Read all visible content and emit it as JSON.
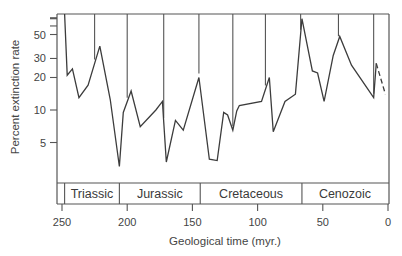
{
  "chart_data": {
    "type": "line",
    "title": "",
    "xlabel": "Geological time (myr.)",
    "ylabel": "Percent extinction rate",
    "x_reversed": true,
    "xlim": [
      250,
      0
    ],
    "y_scale": "log",
    "ylim": [
      2.5,
      100
    ],
    "x_ticks": [
      250,
      200,
      150,
      100,
      50,
      0
    ],
    "y_ticks": [
      5,
      10,
      20,
      30,
      50
    ],
    "y_minor_ticks_top": [
      60,
      70,
      80,
      90
    ],
    "grid": false,
    "legend": null,
    "series": [
      {
        "name": "Extinction rate",
        "style": "solid",
        "x": [
          248,
          246,
          242,
          237,
          230,
          221,
          213,
          206,
          203,
          197,
          190,
          178,
          173,
          170,
          163,
          157,
          145,
          137,
          131,
          126,
          123,
          119,
          116,
          114,
          97,
          91,
          88,
          79,
          71,
          66,
          58,
          54,
          49,
          42,
          37,
          28,
          11,
          9
        ],
        "values": [
          100,
          21,
          24,
          13,
          17,
          39,
          12.5,
          3,
          9.5,
          15,
          7,
          10,
          12,
          3.3,
          8,
          6.5,
          20,
          3.5,
          3.4,
          9.5,
          9,
          6.5,
          9.8,
          11,
          12,
          20,
          6.3,
          12,
          14,
          70,
          23,
          22,
          12,
          32,
          48,
          26,
          13,
          27
        ]
      },
      {
        "name": "Extinction rate (uncertain)",
        "style": "dashed",
        "x": [
          9,
          2
        ],
        "values": [
          27,
          14
        ]
      }
    ],
    "annotations": {
      "boundary_drop_lines_myr": [
        225,
        200,
        172,
        145,
        119,
        94,
        67,
        38,
        11
      ]
    },
    "periods": [
      {
        "name": "Triassic",
        "start": 248,
        "end": 206
      },
      {
        "name": "Jurassic",
        "start": 206,
        "end": 144
      },
      {
        "name": "Cretaceous",
        "start": 144,
        "end": 66
      },
      {
        "name": "Cenozoic",
        "start": 66,
        "end": 0
      }
    ]
  },
  "labels": {
    "y_axis": "Percent extinction rate",
    "x_axis": "Geological time (myr.)",
    "x_ticks": [
      "250",
      "200",
      "150",
      "100",
      "50",
      "0"
    ],
    "y_ticks": [
      "50",
      "30",
      "20",
      "10",
      "5"
    ],
    "periods": [
      "Triassic",
      "Jurassic",
      "Cretaceous",
      "Cenozoic"
    ]
  },
  "colors": {
    "line": "#3c3c3c",
    "axis": "#555555",
    "background": "#ffffff"
  }
}
